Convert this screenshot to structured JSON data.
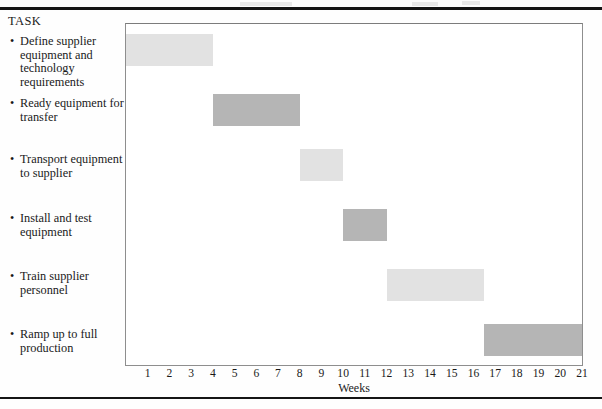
{
  "figure": {
    "task_column_heading": "TASK",
    "bullet_glyph": "•"
  },
  "chart_data": {
    "type": "bar",
    "orientation": "horizontal",
    "subtype": "gantt",
    "title": "",
    "xlabel": "Weeks",
    "ylabel": "TASK",
    "xlim": [
      0,
      21
    ],
    "grid": false,
    "legend": null,
    "xticks": [
      1,
      2,
      3,
      4,
      5,
      6,
      7,
      8,
      9,
      10,
      11,
      12,
      13,
      14,
      15,
      16,
      17,
      18,
      19,
      20,
      21
    ],
    "xtick_labels": [
      "1",
      "2",
      "3",
      "4",
      "5",
      "6",
      "7",
      "8",
      "9",
      "10",
      "11",
      "12",
      "13",
      "14",
      "15",
      "16",
      "17",
      "18",
      "19",
      "20",
      "21"
    ],
    "categories": [
      "Define supplier equipment and technology requirements",
      "Ready equipment for transfer",
      "Transport equipment to supplier",
      "Install and test equipment",
      "Train supplier personnel",
      "Ramp up to full production"
    ],
    "bars": [
      {
        "task": "Define supplier equipment and technology requirements",
        "start_week": 0,
        "end_week": 4,
        "duration_weeks": 4,
        "color": "#e2e2e2"
      },
      {
        "task": "Ready equipment for transfer",
        "start_week": 4,
        "end_week": 8,
        "duration_weeks": 4,
        "color": "#b5b5b5"
      },
      {
        "task": "Transport equipment to supplier",
        "start_week": 8,
        "end_week": 10,
        "duration_weeks": 2,
        "color": "#e2e2e2"
      },
      {
        "task": "Install and test equipment",
        "start_week": 10,
        "end_week": 12,
        "duration_weeks": 2,
        "color": "#b5b5b5"
      },
      {
        "task": "Train supplier personnel",
        "start_week": 12,
        "end_week": 16.5,
        "duration_weeks": 4.5,
        "color": "#e2e2e2"
      },
      {
        "task": "Ramp up to full production",
        "start_week": 16.5,
        "end_week": 21,
        "duration_weeks": 4.5,
        "color": "#b5b5b5"
      }
    ]
  },
  "tasks": [
    {
      "label": "Define supplier equipment and technology requirements",
      "top": 21,
      "bar_top": 10,
      "bar_left": 0.0,
      "bar_width": 87.3
    },
    {
      "label": "Ready equipment for transfer",
      "top": 83,
      "bar_top": 70,
      "bar_left": 87.3,
      "bar_width": 87.3
    },
    {
      "label": "Transport equipment to supplier",
      "top": 139,
      "bar_top": 125,
      "bar_left": 174.6,
      "bar_width": 43.6
    },
    {
      "label": "Install and test equipment",
      "top": 198,
      "bar_top": 185,
      "bar_left": 218.2,
      "bar_width": 43.6
    },
    {
      "label": "Train supplier personnel",
      "top": 256,
      "bar_top": 245,
      "bar_left": 261.8,
      "bar_width": 99.3
    },
    {
      "label": "Ramp up to full production",
      "top": 314,
      "bar_top": 300,
      "bar_left": 361.1,
      "bar_width": 96.9
    }
  ],
  "colors": {
    "bar_light": "#e2e2e2",
    "bar_dark": "#b5b5b5",
    "frame": "#8e8e8e",
    "rule": "#151515",
    "page": "#fefefe",
    "text": "#1a1a1a"
  }
}
